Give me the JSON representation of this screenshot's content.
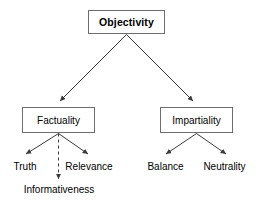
{
  "diagram": {
    "type": "hierarchy-tree",
    "title_node": "Objectivity",
    "nodes": {
      "root": {
        "label": "Objectivity",
        "style": "bold-box"
      },
      "left_branch": {
        "label": "Factuality",
        "style": "box"
      },
      "right_branch": {
        "label": "Impartiality",
        "style": "box"
      },
      "leaf_truth": {
        "label": "Truth",
        "style": "plain-text"
      },
      "leaf_relevance": {
        "label": "Relevance",
        "style": "plain-text"
      },
      "leaf_informativeness": {
        "label": "Informativeness",
        "style": "plain-text"
      },
      "leaf_balance": {
        "label": "Balance",
        "style": "plain-text"
      },
      "leaf_neutrality": {
        "label": "Neutrality",
        "style": "plain-text"
      }
    },
    "edges": [
      {
        "from": "Objectivity",
        "to": "Factuality",
        "line": "solid",
        "arrow": true
      },
      {
        "from": "Objectivity",
        "to": "Impartiality",
        "line": "solid",
        "arrow": true
      },
      {
        "from": "Factuality",
        "to": "Truth",
        "line": "solid",
        "arrow": true
      },
      {
        "from": "Factuality",
        "to": "Relevance",
        "line": "solid",
        "arrow": true
      },
      {
        "from": "Factuality",
        "to": "Informativeness",
        "line": "dashed",
        "arrow": true
      },
      {
        "from": "Impartiality",
        "to": "Balance",
        "line": "solid",
        "arrow": true
      },
      {
        "from": "Impartiality",
        "to": "Neutrality",
        "line": "solid",
        "arrow": true
      }
    ],
    "colors": {
      "background": "#ffffff",
      "box_border": "#6e6e6e",
      "box_fill": "#ffffff",
      "edge": "#3b3b3b",
      "text": "#000000"
    }
  }
}
